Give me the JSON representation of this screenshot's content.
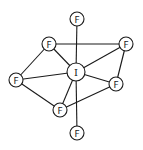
{
  "diagram": {
    "type": "molecular-structure",
    "molecule": "IF7",
    "geometry": "pentagonal bipyramidal",
    "colors": {
      "stroke": "#1a1a1a",
      "fill": "#ffffff"
    },
    "atom_radius": 7,
    "center_radius": 9,
    "atoms": [
      {
        "id": "I",
        "label": "I",
        "x": 76,
        "y": 72,
        "role": "central"
      },
      {
        "id": "F1",
        "label": "F",
        "x": 77,
        "y": 19,
        "role": "axial-top"
      },
      {
        "id": "F2",
        "label": "F",
        "x": 77,
        "y": 133,
        "role": "axial-bottom"
      },
      {
        "id": "F3",
        "label": "F",
        "x": 49,
        "y": 44,
        "role": "equatorial-upper-left"
      },
      {
        "id": "F4",
        "label": "F",
        "x": 126,
        "y": 44,
        "role": "equatorial-upper-right"
      },
      {
        "id": "F5",
        "label": "F",
        "x": 16,
        "y": 80,
        "role": "equatorial-left"
      },
      {
        "id": "F6",
        "label": "F",
        "x": 116,
        "y": 84,
        "role": "equatorial-right"
      },
      {
        "id": "F7",
        "label": "F",
        "x": 60,
        "y": 110,
        "role": "equatorial-lower-left"
      }
    ],
    "bonds": [
      [
        "I",
        "F1"
      ],
      [
        "I",
        "F2"
      ],
      [
        "I",
        "F3"
      ],
      [
        "I",
        "F4"
      ],
      [
        "I",
        "F5"
      ],
      [
        "I",
        "F6"
      ],
      [
        "I",
        "F7"
      ],
      [
        "F3",
        "F4"
      ],
      [
        "F4",
        "F6"
      ],
      [
        "F6",
        "F7"
      ],
      [
        "F7",
        "F5"
      ],
      [
        "F5",
        "F3"
      ]
    ]
  }
}
